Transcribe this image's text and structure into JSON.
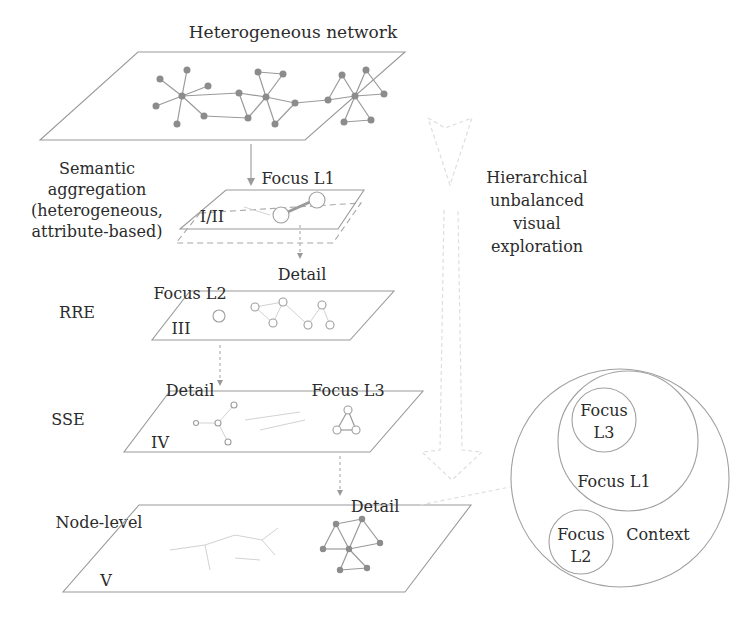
{
  "title": "Heterogeneous network",
  "side_note": {
    "lines": [
      "Hierarchical",
      "unbalanced",
      "visual",
      "exploration"
    ]
  },
  "levels": [
    {
      "id": "I/II",
      "roman": "I/II",
      "left_label_lines": [
        "Semantic",
        "aggregation",
        "(heterogeneous,",
        "attribute-based)"
      ],
      "top_label": "Focus L1",
      "detail_label": "Detail"
    },
    {
      "id": "III",
      "roman": "III",
      "left_label_lines": [
        "RRE"
      ],
      "focus_label": "Focus L2",
      "detail_label": "Detail"
    },
    {
      "id": "IV",
      "roman": "IV",
      "left_label_lines": [
        "SSE"
      ],
      "focus_label": "Focus L3",
      "detail_label": "Detail"
    },
    {
      "id": "V",
      "roman": "V",
      "left_label_lines": [
        "Node-level"
      ]
    }
  ],
  "venn": {
    "outer_label": "Context",
    "focus_l1": "Focus L1",
    "focus_l3_lines": [
      "Focus",
      "L3"
    ],
    "focus_l2_lines": [
      "Focus",
      "L2"
    ]
  },
  "colors": {
    "line": "#9a9a9a",
    "node": "#8c8c8c",
    "text": "#2b2b2b",
    "faint": "#dedede"
  }
}
